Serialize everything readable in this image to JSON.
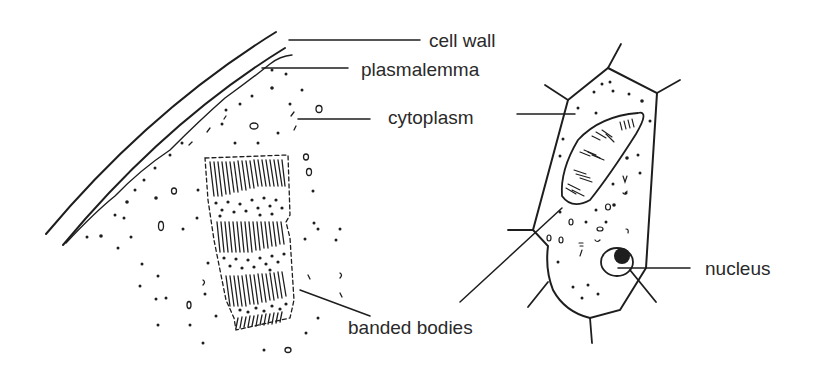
{
  "diagram": {
    "type": "biological cell illustration",
    "left_panel": "enlarged section of cell periphery with banded body",
    "right_panel": "whole cell with banded body and nucleus",
    "line_color": "#1e1e1e",
    "label_color": "#2a2a2a",
    "labels": {
      "cell_wall": "cell wall",
      "plasmalemma": "plasmalemma",
      "cytoplasm": "cytoplasm",
      "banded_bodies": "banded bodies",
      "nucleus": "nucleus"
    }
  }
}
